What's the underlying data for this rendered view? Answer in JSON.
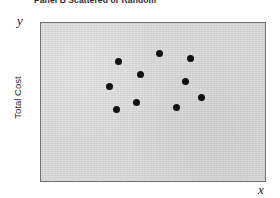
{
  "figure": {
    "caption": "Panel B   Scattered or Random",
    "y_axis_letter": "y",
    "x_axis_letter": "x",
    "y_axis_title": "Total Cost",
    "x_axis_title": "",
    "panel_color": "#d5d5d5",
    "point_color": "#111111",
    "border_color": "#6f6f6f"
  },
  "chart_data": {
    "type": "scatter",
    "title": "Panel B   Scattered or Random",
    "xlabel": "x",
    "ylabel": "Total Cost",
    "grid": false,
    "legend": null,
    "axis_letters": {
      "x": "x",
      "y": "y"
    },
    "tick_labels": {
      "x": [],
      "y": []
    },
    "xlim": [
      0,
      100
    ],
    "ylim": [
      0,
      100
    ],
    "n_points": 10,
    "marker": "filled-circle",
    "marker_color": "#111111",
    "points": [
      {
        "x": 34.5,
        "y": 75.6
      },
      {
        "x": 52.7,
        "y": 80.6
      },
      {
        "x": 66.8,
        "y": 77.5
      },
      {
        "x": 44.2,
        "y": 67.5
      },
      {
        "x": 30.5,
        "y": 60.0
      },
      {
        "x": 64.6,
        "y": 63.1
      },
      {
        "x": 42.5,
        "y": 50.0
      },
      {
        "x": 71.7,
        "y": 53.1
      },
      {
        "x": 60.6,
        "y": 46.3
      },
      {
        "x": 33.6,
        "y": 45.0
      }
    ]
  }
}
